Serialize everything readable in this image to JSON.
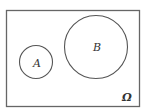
{
  "diagram": {
    "type": "venn",
    "universe": {
      "label": "Ω"
    },
    "sets": [
      {
        "label": "A"
      },
      {
        "label": "B"
      }
    ],
    "stroke": "#555555"
  }
}
